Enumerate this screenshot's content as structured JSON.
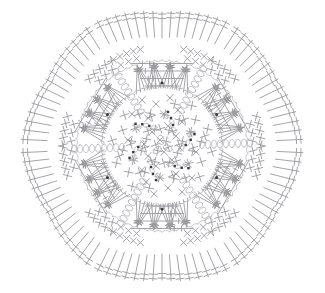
{
  "document": {
    "title": "Crochet Hexagon Motif Chart",
    "type": "crochet-stitch-diagram",
    "background_color": "#ffffff",
    "width": 325,
    "height": 293
  },
  "style": {
    "line_color": "#9a9a9f",
    "line_color_light": "#b4b4b9",
    "dot_color": "#3a3a3a",
    "stroke_width": 0.9,
    "stroke_width_thin": 0.75
  },
  "legend": {
    "symbols": [
      {
        "name": "chain-stitch",
        "glyph": "oval",
        "label": "ch"
      },
      {
        "name": "single-crochet",
        "glyph": "cross",
        "label": "sc"
      },
      {
        "name": "treble-crochet",
        "glyph": "line-with-two-bars",
        "label": "tr"
      },
      {
        "name": "double-crochet",
        "glyph": "line-with-one-bar",
        "label": "dc"
      },
      {
        "name": "slip-stitch",
        "glyph": "dot",
        "label": "sl st"
      }
    ]
  },
  "motif": {
    "shape": "hexagon",
    "symmetry": 6,
    "center_x": 162,
    "center_y": 146,
    "rounds": [
      {
        "index": 1,
        "name": "center-ring",
        "symbol": "chain-oval-trefoil",
        "count": 3
      },
      {
        "index": 2,
        "name": "inner-sc-field",
        "symbol": "single-crochet",
        "count": 72
      },
      {
        "index": 3,
        "name": "mid-chain-ring",
        "symbol": "chain-stitch",
        "count": 36
      },
      {
        "index": 4,
        "name": "treble-cluster-ring",
        "symbol": "treble-crochet",
        "count": 48
      },
      {
        "index": 5,
        "name": "outer-chain-arcs",
        "symbol": "chain-stitch",
        "count": 42
      },
      {
        "index": 6,
        "name": "outer-treble-fans",
        "symbol": "treble-crochet",
        "count": 66
      },
      {
        "index": 7,
        "name": "edge-sc-border",
        "symbol": "single-crochet",
        "count": 54
      }
    ],
    "corner_markers": {
      "symbol": "slip-stitch-dot",
      "count": 6
    },
    "hex_vertices": [
      {
        "x": 162,
        "y": -16
      },
      {
        "x": 303,
        "y": 65
      },
      {
        "x": 303,
        "y": 227
      },
      {
        "x": 162,
        "y": 308
      },
      {
        "x": 21,
        "y": 227
      },
      {
        "x": 21,
        "y": 65
      }
    ]
  }
}
